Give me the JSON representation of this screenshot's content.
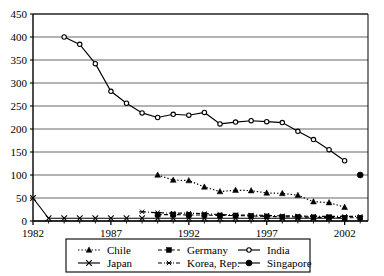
{
  "chart_data": {
    "type": "line",
    "title": "",
    "xlabel": "",
    "ylabel": "",
    "xlim": [
      1982,
      2003.5
    ],
    "ylim": [
      0,
      450
    ],
    "grid": true,
    "legend_position": "bottom",
    "y_ticks": [
      0,
      50,
      100,
      150,
      200,
      250,
      300,
      350,
      400,
      450
    ],
    "x_ticks": [
      1982,
      1987,
      1992,
      1997,
      2002
    ],
    "x_tick_labels": [
      "1982",
      "1987",
      "1992",
      "1997",
      "2002"
    ],
    "x_minor_step": 1,
    "series": [
      {
        "name": "Chile",
        "marker": "triangle",
        "line_style": "dotted",
        "color": "#000000",
        "x": [
          1990,
          1991,
          1992,
          1993,
          1994,
          1995,
          1996,
          1997,
          1998,
          1999,
          2000,
          2001,
          2002
        ],
        "values": [
          100,
          89,
          88,
          74,
          64,
          67,
          66,
          61,
          60,
          56,
          42,
          40,
          30
        ]
      },
      {
        "name": "Germany",
        "marker": "square",
        "line_style": "dashed",
        "color": "#000000",
        "x": [
          1990,
          1991,
          1992,
          1993,
          1994,
          1995,
          1996,
          1997,
          1998,
          1999,
          2000,
          2001,
          2002,
          2003
        ],
        "values": [
          14,
          14,
          13,
          13,
          12,
          12,
          11,
          10,
          9,
          9,
          8,
          8,
          7,
          7
        ]
      },
      {
        "name": "India",
        "marker": "circle-open",
        "line_style": "solid",
        "color": "#000000",
        "x": [
          1984,
          1985,
          1986,
          1987,
          1988,
          1989,
          1990,
          1991,
          1992,
          1993,
          1994,
          1995,
          1996,
          1997,
          1998,
          1999,
          2000,
          2001,
          2002
        ],
        "values": [
          400,
          384,
          342,
          282,
          256,
          235,
          225,
          232,
          230,
          236,
          211,
          215,
          218,
          216,
          214,
          195,
          177,
          155,
          131
        ]
      },
      {
        "name": "Japan",
        "marker": "x",
        "line_style": "solid",
        "color": "#000000",
        "x": [
          1982,
          1983,
          1984,
          1985,
          1986,
          1987,
          1988,
          1989,
          1990,
          1991,
          1992,
          1993,
          1994,
          1995,
          1996,
          1997,
          1998,
          1999,
          2000,
          2001,
          2002
        ],
        "values": [
          50,
          6,
          6,
          6,
          6,
          6,
          6,
          6,
          6,
          6,
          6,
          6,
          6,
          6,
          6,
          6,
          6,
          6,
          6,
          6,
          6
        ]
      },
      {
        "name": "Korea, Rep.",
        "marker": "asterisk",
        "line_style": "dash-dot",
        "color": "#000000",
        "x": [
          1989,
          1990,
          1991,
          1992,
          1993,
          1994,
          1995,
          1996,
          1997,
          1998,
          1999,
          2000,
          2001,
          2002,
          2003
        ],
        "values": [
          20,
          18,
          17,
          17,
          16,
          14,
          13,
          13,
          12,
          11,
          11,
          10,
          10,
          10,
          10
        ]
      },
      {
        "name": "Singapore",
        "marker": "circle-filled",
        "line_style": "solid",
        "color": "#000000",
        "x": [
          2003
        ],
        "values": [
          100
        ]
      }
    ]
  },
  "legend": {
    "entries": [
      {
        "label": "Chile",
        "marker": "triangle",
        "line_style": "dotted"
      },
      {
        "label": "Germany",
        "marker": "square",
        "line_style": "dashed"
      },
      {
        "label": "India",
        "marker": "circle-open",
        "line_style": "solid"
      },
      {
        "label": "Japan",
        "marker": "x",
        "line_style": "solid"
      },
      {
        "label": "Korea, Rep.",
        "marker": "asterisk",
        "line_style": "dash-dot"
      },
      {
        "label": "Singapore",
        "marker": "circle-filled",
        "line_style": "solid"
      }
    ]
  },
  "axis": {
    "y_labels": [
      "450",
      "400",
      "350",
      "300",
      "250",
      "200",
      "150",
      "100",
      "50",
      "0"
    ],
    "x_labels": [
      "1982",
      "1987",
      "1992",
      "1997",
      "2002"
    ]
  },
  "colors": {
    "ink": "#000000",
    "grid": "#555555",
    "background": "#ffffff"
  }
}
